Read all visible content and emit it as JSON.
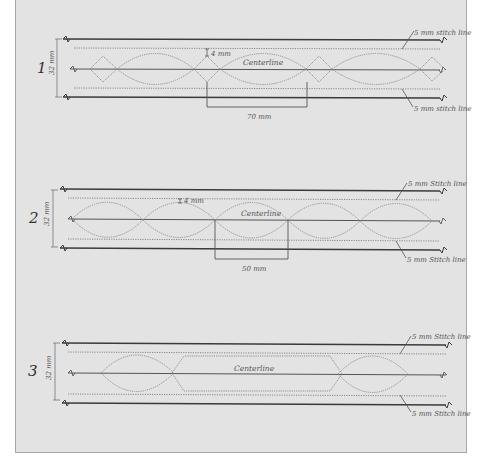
{
  "canvas": {
    "width": 482,
    "height": 463,
    "panel_bg": "#e3e3e3",
    "line_color": "#3a3a3a",
    "guide_color": "#8a8a8a"
  },
  "diagrams": [
    {
      "number": "1",
      "height_label": "32 mm",
      "centerline_label": "Centerline",
      "offset_label": "4 mm",
      "span_label": "70 mm",
      "stitch_top_label": "5 mm stitch line",
      "stitch_bottom_label": "5 mm stitch line",
      "pattern": "lens-with-diamonds"
    },
    {
      "number": "2",
      "height_label": "32 mm",
      "centerline_label": "Centerline",
      "offset_label": "4 mm",
      "span_label": "50 mm",
      "stitch_top_label": "5 mm Stitch line",
      "stitch_bottom_label": "5 mm Stitch line",
      "pattern": "continuous-lenses"
    },
    {
      "number": "3",
      "height_label": "32 mm",
      "centerline_label": "Centerline",
      "stitch_top_label": "5 mm Stitch line",
      "stitch_bottom_label": "5 mm Stitch line",
      "pattern": "lens-hexagon-lens"
    }
  ]
}
